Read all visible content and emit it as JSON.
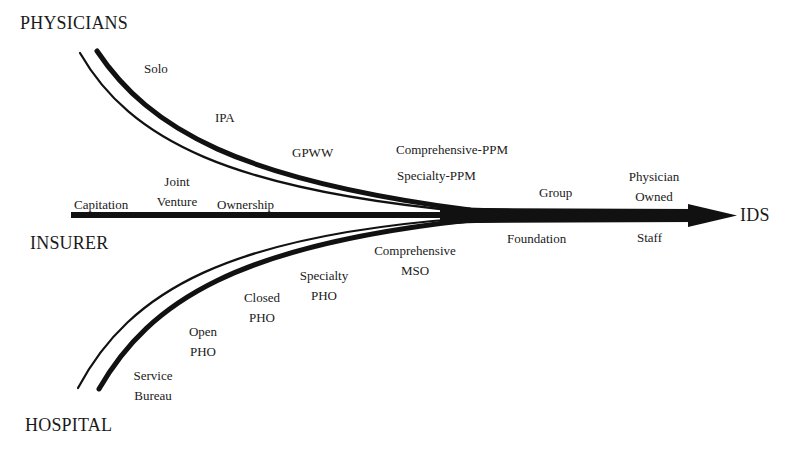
{
  "diagram": {
    "type": "convergence-flow",
    "sources": {
      "physicians": "PHYSICIANS",
      "insurer": "INSURER",
      "hospital": "HOSPITAL"
    },
    "target": "IDS",
    "physician_path": [
      {
        "label": "Solo"
      },
      {
        "label": "IPA"
      },
      {
        "label": "GPWW"
      },
      {
        "label": "Comprehensive-PPM"
      },
      {
        "label": "Specialty-PPM"
      }
    ],
    "insurer_path": [
      {
        "label": "Capitation"
      },
      {
        "line1": "Joint",
        "line2": "Venture"
      },
      {
        "label": "Ownership"
      }
    ],
    "hospital_path": [
      {
        "line1": "Service",
        "line2": "Bureau"
      },
      {
        "line1": "Open",
        "line2": "PHO"
      },
      {
        "line1": "Closed",
        "line2": "PHO"
      },
      {
        "line1": "Specialty",
        "line2": "PHO"
      },
      {
        "line1": "Comprehensive",
        "line2": "MSO"
      }
    ],
    "merged_path_above": [
      {
        "label": "Group"
      },
      {
        "line1": "Physician",
        "line2": "Owned"
      }
    ],
    "merged_path_below": [
      {
        "label": "Foundation"
      },
      {
        "label": "Staff"
      }
    ],
    "colors": {
      "stroke": "#111111",
      "background": "#ffffff",
      "text": "#1a1a1a"
    }
  }
}
